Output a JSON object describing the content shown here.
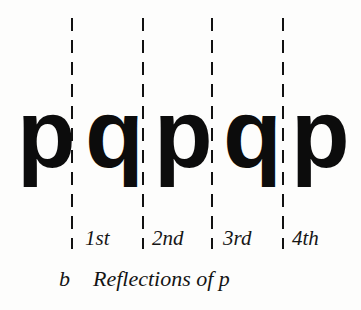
{
  "figure": {
    "caption_label": "b",
    "caption_title": "Reflections of p",
    "background_color": "#fdfdfc",
    "ink_color": "#0c0c0c"
  },
  "mirrors": [
    {
      "name": "mirror-line-1",
      "ordinal": "1st"
    },
    {
      "name": "mirror-line-2",
      "ordinal": "2nd"
    },
    {
      "name": "mirror-line-3",
      "ordinal": "3rd"
    },
    {
      "name": "mirror-line-4",
      "ordinal": "4th"
    }
  ],
  "glyphs": [
    {
      "char": "p",
      "mirrored": false
    },
    {
      "char": "p",
      "mirrored": true
    },
    {
      "char": "p",
      "mirrored": false
    },
    {
      "char": "p",
      "mirrored": true
    },
    {
      "char": "p",
      "mirrored": false
    }
  ],
  "glyph_sequence": "p q p q p"
}
